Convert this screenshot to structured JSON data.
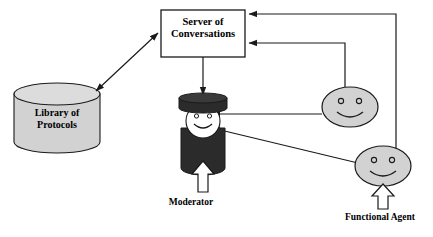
{
  "diagram": {
    "colors": {
      "stroke": "#1a1a1a",
      "fill_light_gray": "#d2d2d2",
      "fill_dark": "#2b2b2b",
      "face_white": "#ffffff",
      "background": "#ffffff"
    },
    "nodes": {
      "server": {
        "label": "Server of\nConversations",
        "shape": "rectangle"
      },
      "library": {
        "label": "Library of\nProtocols",
        "shape": "cylinder"
      },
      "moderator": {
        "label": "Moderator",
        "shape": "figure-with-hat"
      },
      "agent_upper": {
        "label": "",
        "shape": "smiley-face"
      },
      "agent_lower": {
        "label": "",
        "shape": "smiley-face"
      },
      "functional_agent": {
        "label": "Functional Agent",
        "shape": "label-with-hollow-arrow"
      }
    },
    "connectors": [
      {
        "name": "library-server",
        "from": "library",
        "to": "server",
        "style": "double-headed-arrow"
      },
      {
        "name": "server-moderator",
        "from": "server",
        "to": "moderator",
        "style": "arrow-down"
      },
      {
        "name": "agent-upper-server",
        "from": "agent_upper",
        "to": "server",
        "style": "orthogonal-arrow"
      },
      {
        "name": "agent-lower-server",
        "from": "agent_lower",
        "to": "server",
        "style": "orthogonal-arrow"
      },
      {
        "name": "agent-upper-moderator",
        "from": "agent_upper",
        "to": "moderator",
        "style": "arrow-left"
      },
      {
        "name": "agent-lower-moderator",
        "from": "agent_lower",
        "to": "moderator",
        "style": "diagonal-arrow"
      },
      {
        "name": "moderator-input",
        "to": "moderator",
        "style": "hollow-arrow-up"
      },
      {
        "name": "functional-agent-input",
        "to": "agent_lower",
        "style": "hollow-arrow-up"
      }
    ]
  }
}
